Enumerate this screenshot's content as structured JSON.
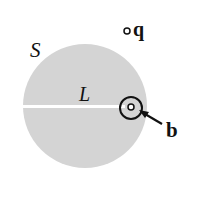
{
  "figure": {
    "labels": {
      "surface": "S",
      "line": "L",
      "charge": "q",
      "boundary": "b"
    },
    "colors": {
      "disk_fill": "#d4d4d4",
      "stroke": "#111111",
      "background": "#ffffff",
      "cut_line": "#ffffff"
    }
  }
}
